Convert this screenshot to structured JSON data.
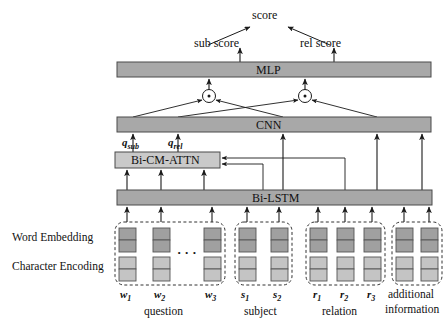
{
  "figure": {
    "type": "neural-network-architecture-diagram",
    "colors": {
      "bar_fill": "#a8a8a8",
      "bar_stroke": "#4a4a4a",
      "box_fill": "#c9c9c9",
      "word_cell_fill": "#a0a0a0",
      "char_cell_fill": "#c4c4c4",
      "cell_stroke": "#555555",
      "line": "#1a1a1a",
      "dashed_group": "#333333"
    }
  },
  "top": {
    "score_label": "score",
    "sub_score_label": "sub score",
    "rel_score_label": "rel score"
  },
  "layers": {
    "mlp_label": "MLP",
    "cnn_label": "CNN",
    "attn_label": "Bi-CM-ATTN",
    "lstm_label": "Bi-LSTM"
  },
  "merge_nodes": [
    {
      "name": "sub-merge",
      "symbol": "·"
    },
    {
      "name": "rel-merge",
      "symbol": "·"
    }
  ],
  "attention_outputs": [
    {
      "name": "q-sub",
      "base": "q",
      "sub": "sub"
    },
    {
      "name": "q-rel",
      "base": "q",
      "sub": "rel"
    }
  ],
  "row_labels": {
    "word_embedding": "Word Embedding",
    "character_encoding": "Character Encoding"
  },
  "ellipsis": "· · ·",
  "input_groups": [
    {
      "name": "question",
      "caption": "question",
      "caption_lines": [
        "question"
      ],
      "has_ellipsis": true,
      "tokens": [
        {
          "base": "w",
          "sub": "1"
        },
        {
          "base": "w",
          "sub": "2"
        },
        {
          "base": "w",
          "sub": "3"
        }
      ]
    },
    {
      "name": "subject",
      "caption": "subject",
      "caption_lines": [
        "subject"
      ],
      "has_ellipsis": false,
      "tokens": [
        {
          "base": "s",
          "sub": "1"
        },
        {
          "base": "s",
          "sub": "2"
        }
      ]
    },
    {
      "name": "relation",
      "caption": "relation",
      "caption_lines": [
        "relation"
      ],
      "has_ellipsis": false,
      "tokens": [
        {
          "base": "r",
          "sub": "1"
        },
        {
          "base": "r",
          "sub": "2"
        },
        {
          "base": "r",
          "sub": "3"
        }
      ]
    },
    {
      "name": "additional-information",
      "caption": "additional information",
      "caption_lines": [
        "additional",
        "information"
      ],
      "has_ellipsis": false,
      "tokens": [
        {
          "base": "",
          "sub": ""
        },
        {
          "base": "",
          "sub": ""
        }
      ]
    }
  ]
}
